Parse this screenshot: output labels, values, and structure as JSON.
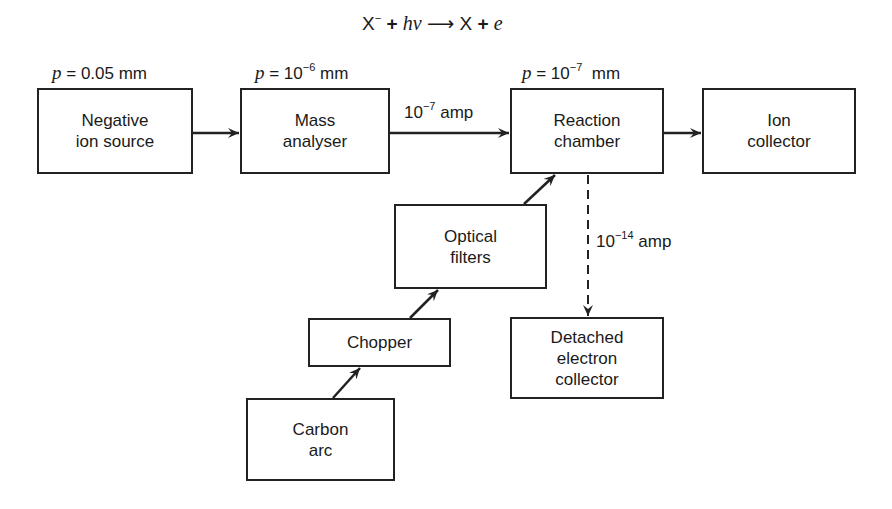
{
  "equation": {
    "reactant": "X",
    "reactant_charge": "−",
    "plus1": "+",
    "photon": "hν",
    "arrow": "⟶",
    "product": "X",
    "plus2": "+",
    "electron": "e"
  },
  "pressures": {
    "ion_source": {
      "var": "p",
      "eq": " = ",
      "value": "0.05 mm"
    },
    "mass_analyser": {
      "var": "p",
      "eq": " = 10",
      "exp": "−6",
      "unit": " mm"
    },
    "reaction_chamber": {
      "var": "p",
      "eq": " = 10",
      "exp": "−7",
      "unit": "  mm"
    }
  },
  "currents": {
    "ion_beam": {
      "base": "10",
      "exp": "−7",
      "unit": " amp"
    },
    "electron": {
      "base": "10",
      "exp": "−14",
      "unit": " amp"
    }
  },
  "boxes": {
    "negative_ion_source": [
      "Negative",
      "ion source"
    ],
    "mass_analyser": [
      "Mass",
      "analyser"
    ],
    "reaction_chamber": [
      "Reaction",
      "chamber"
    ],
    "ion_collector": [
      "Ion",
      "collector"
    ],
    "optical_filters": [
      "Optical",
      "filters"
    ],
    "chopper": [
      "Chopper"
    ],
    "carbon_arc": [
      "Carbon",
      "arc"
    ],
    "detached_electron_collector": [
      "Detached",
      "electron",
      "collector"
    ]
  },
  "colors": {
    "line": "#222222",
    "background": "#ffffff"
  }
}
